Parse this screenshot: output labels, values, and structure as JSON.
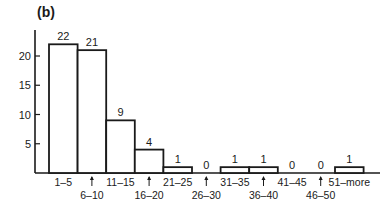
{
  "chart_data": {
    "type": "bar",
    "title": "(b)",
    "panel_label": "(b)",
    "xlabel": "",
    "ylabel": "",
    "categories": [
      "1–5",
      "6–10",
      "11–15",
      "16–20",
      "21–25",
      "26–30",
      "31–35",
      "36–40",
      "41–45",
      "46–50",
      "51–more"
    ],
    "values": [
      22,
      21,
      9,
      4,
      1,
      0,
      1,
      1,
      0,
      0,
      1
    ],
    "data_labels": [
      "22",
      "21",
      "9",
      "4",
      "1",
      "0",
      "1",
      "1",
      "0",
      "0",
      "1"
    ],
    "yticks": [
      5,
      10,
      15,
      20
    ],
    "ylim": [
      0,
      25
    ],
    "grid": false,
    "legend": null,
    "label_layout": "alternating rows; lower-row labels marked with upward arrow"
  }
}
